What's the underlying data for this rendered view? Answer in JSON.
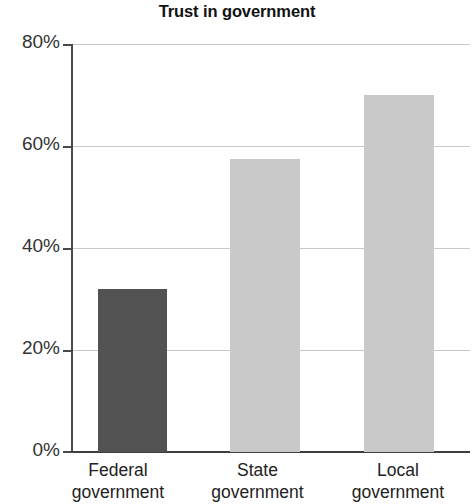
{
  "chart_data": {
    "type": "bar",
    "title": "Trust in government",
    "xlabel": "",
    "ylabel": "",
    "categories": [
      "Federal government",
      "State government",
      "Local government"
    ],
    "category_lines": [
      [
        "Federal",
        "government"
      ],
      [
        "State",
        "government"
      ],
      [
        "Local",
        "government"
      ]
    ],
    "values": [
      32,
      57.5,
      70
    ],
    "value_labels": [
      "32%",
      "57.5%",
      "70%"
    ],
    "bar_colors": [
      "#525252",
      "#c9c9c9",
      "#c9c9c9"
    ],
    "ylim": [
      0,
      80
    ],
    "yticks": [
      0,
      20,
      40,
      60,
      80
    ],
    "ytick_labels": [
      "0%",
      "20%",
      "40%",
      "60%",
      "80%"
    ],
    "grid": true,
    "grid_axis": "y",
    "legend": false,
    "units": "percent"
  },
  "colors": {
    "background": "#ffffff",
    "axis": "#4a4a4a",
    "grid": "#c9c9c9",
    "text": "#1a1a1a",
    "bar_dark": "#525252",
    "bar_light": "#c9c9c9"
  }
}
